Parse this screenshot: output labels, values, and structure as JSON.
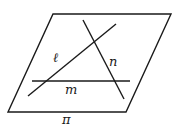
{
  "diagram": {
    "width": 184,
    "height": 128,
    "stroke_color": "#1a1a1a",
    "plane": {
      "name": "π",
      "label": "π",
      "vertices": [
        [
          53,
          14
        ],
        [
          171,
          14
        ],
        [
          126,
          112
        ],
        [
          8,
          112
        ]
      ],
      "label_pos": [
        62,
        124
      ]
    },
    "lines": [
      {
        "name": "ℓ",
        "label": "ℓ",
        "from": [
          28,
          96
        ],
        "to": [
          116,
          24
        ],
        "label_pos": [
          53,
          62
        ]
      },
      {
        "name": "n",
        "label": "n",
        "from": [
          83,
          20
        ],
        "to": [
          124,
          99
        ],
        "label_pos": [
          109,
          66
        ]
      },
      {
        "name": "m",
        "label": "m",
        "from": [
          32,
          81
        ],
        "to": [
          130,
          81
        ],
        "label_pos": [
          65,
          94
        ]
      }
    ]
  }
}
